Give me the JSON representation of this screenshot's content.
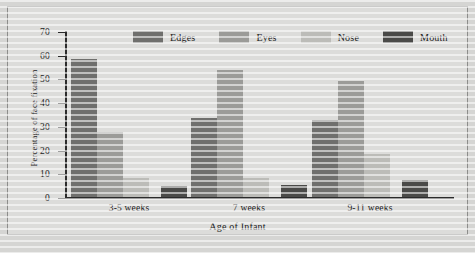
{
  "chart_data": {
    "type": "bar",
    "title": "",
    "xlabel": "Age of Infant",
    "ylabel": "Percentage of face fixation",
    "categories": [
      "3-5 weeks",
      "7 weeks",
      "9-11 weeks"
    ],
    "series": [
      {
        "name": "Edges",
        "color": "#6f6f6d",
        "values": [
          58,
          33.5,
          32.5
        ]
      },
      {
        "name": "Eyes",
        "color": "#9b9b98",
        "values": [
          27.5,
          53.5,
          49
        ]
      },
      {
        "name": "Nose",
        "color": "#bcbcb8",
        "values": [
          8,
          8,
          18
        ]
      },
      {
        "name": "Mouth",
        "color": "#4a4a48",
        "values": [
          4.5,
          5,
          7
        ]
      }
    ],
    "ylim": [
      0,
      70
    ],
    "yticks": [
      0,
      10,
      20,
      30,
      40,
      50,
      60,
      70
    ],
    "ytick_labels": [
      "0",
      "10",
      "20",
      "30",
      "40",
      "50",
      "60",
      "70"
    ],
    "grid": false,
    "legend_position": "top-center"
  },
  "colors": {
    "plate_background": "#dcdcda",
    "page_background": "#d5d5d3",
    "frame_border": "#8c8c8a",
    "axis": "#2b2b2b",
    "text": "#1b1b1b"
  }
}
